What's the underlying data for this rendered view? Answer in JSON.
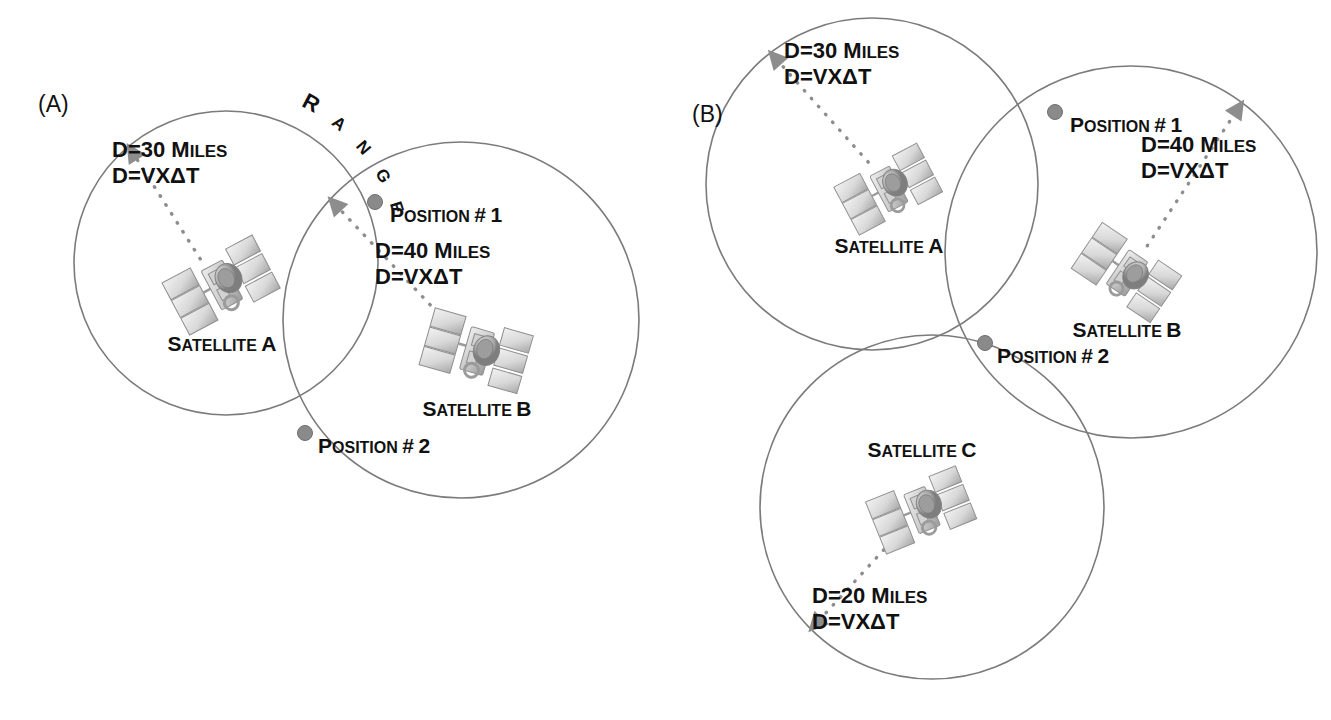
{
  "figure": {
    "type": "diagram",
    "background_color": "#ffffff",
    "circle_stroke_color": "#7b7b7b",
    "node_color": "#8a8a8a",
    "leader_color": "#8d8d8d",
    "text_color": "#111111"
  },
  "panels": [
    {
      "id": "A",
      "label": "(A)",
      "range_label": "RANGE",
      "circles": [
        {
          "name": "range-circle-satellite-a",
          "cx": 226,
          "cy": 263,
          "r": 152
        },
        {
          "name": "range-circle-satellite-b",
          "cx": 461,
          "cy": 320,
          "r": 178
        }
      ],
      "satellites": [
        {
          "name": "satellite-a",
          "label": "SATELLITE A",
          "x": 222,
          "y": 285,
          "label_x": 222,
          "label_y": 351,
          "rotation": -28,
          "scale": 1.0
        },
        {
          "name": "satellite-b",
          "label": "SATELLITE B",
          "x": 477,
          "y": 351,
          "label_x": 477,
          "label_y": 416,
          "rotation": 16,
          "scale": 1.0
        }
      ],
      "distances": [
        {
          "name": "distance-satellite-a",
          "line1": "D=30 MILES",
          "line2": "D=VXΔT",
          "x": 112,
          "y": 157
        },
        {
          "name": "distance-satellite-b",
          "line1": "D=40 MILES",
          "line2": "D=VXΔT",
          "x": 375,
          "y": 258
        }
      ],
      "positions": [
        {
          "name": "position-1",
          "label": "POSITION # 1",
          "dot_x": 375,
          "dot_y": 202,
          "label_x": 390,
          "label_y": 222
        },
        {
          "name": "position-2",
          "label": "POSITION # 2",
          "dot_x": 305,
          "dot_y": 433,
          "label_x": 318,
          "label_y": 453
        }
      ]
    },
    {
      "id": "B",
      "label": "(B)",
      "range_label": "",
      "circles": [
        {
          "name": "range-circle-satellite-a",
          "cx": 872,
          "cy": 184,
          "r": 166
        },
        {
          "name": "range-circle-satellite-b",
          "cx": 1131,
          "cy": 252,
          "r": 186
        },
        {
          "name": "range-circle-satellite-c",
          "cx": 932,
          "cy": 507,
          "r": 172
        }
      ],
      "satellites": [
        {
          "name": "satellite-a",
          "label": "SATELLITE A",
          "x": 889,
          "y": 189,
          "label_x": 889,
          "label_y": 253,
          "rotation": -28,
          "scale": 0.92
        },
        {
          "name": "satellite-b",
          "label": "SATELLITE B",
          "x": 1127,
          "y": 273,
          "label_x": 1127,
          "label_y": 337,
          "rotation": 34,
          "scale": 0.94
        },
        {
          "name": "satellite-c",
          "label": "SATELLITE C",
          "x": 922,
          "y": 510,
          "label_x": 922,
          "label_y": 457,
          "rotation": -22,
          "scale": 0.95
        }
      ],
      "distances": [
        {
          "name": "distance-satellite-a",
          "line1": "D=30 MILES",
          "line2": "D=VXΔT",
          "x": 784,
          "y": 58
        },
        {
          "name": "distance-satellite-b",
          "line1": "D=40 MILES",
          "line2": "D=VXΔT",
          "x": 1141,
          "y": 152
        },
        {
          "name": "distance-satellite-c",
          "line1": "D=20 MILES",
          "line2": "D=VXΔT",
          "x": 812,
          "y": 603
        }
      ],
      "positions": [
        {
          "name": "position-1",
          "label": "POSITION # 1",
          "dot_x": 1055,
          "dot_y": 112,
          "label_x": 1070,
          "label_y": 132
        },
        {
          "name": "position-2",
          "label": "POSITION # 2",
          "dot_x": 985,
          "dot_y": 343,
          "label_x": 997,
          "label_y": 363
        }
      ]
    }
  ],
  "chart_data": {
    "type": "diagram",
    "title": "",
    "measurements": [
      {
        "satellite": "SATELLITE A",
        "distance_miles": 30,
        "formula": "D=VXΔT",
        "panel": "A"
      },
      {
        "satellite": "SATELLITE B",
        "distance_miles": 40,
        "formula": "D=VXΔT",
        "panel": "A"
      },
      {
        "satellite": "SATELLITE A",
        "distance_miles": 30,
        "formula": "D=VXΔT",
        "panel": "B"
      },
      {
        "satellite": "SATELLITE B",
        "distance_miles": 40,
        "formula": "D=VXΔT",
        "panel": "B"
      },
      {
        "satellite": "SATELLITE C",
        "distance_miles": 20,
        "formula": "D=VXΔT",
        "panel": "B"
      }
    ],
    "intersections": [
      {
        "panel": "A",
        "label": "POSITION # 1"
      },
      {
        "panel": "A",
        "label": "POSITION # 2"
      },
      {
        "panel": "B",
        "label": "POSITION # 1"
      },
      {
        "panel": "B",
        "label": "POSITION # 2"
      }
    ]
  }
}
